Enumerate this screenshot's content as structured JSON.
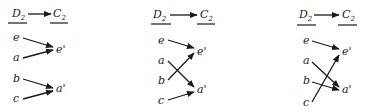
{
  "diagram": {
    "panels": [
      {
        "id": "panel-1",
        "header": {
          "source": "D",
          "source_sub": "2",
          "target": "C",
          "target_sub": "2"
        },
        "domain": [
          "e",
          "a",
          "b",
          "c"
        ],
        "codomain": [
          "e'",
          "a'"
        ],
        "mapping": {
          "e": "e'",
          "a": "e'",
          "b": "a'",
          "c": "a'"
        }
      },
      {
        "id": "panel-2",
        "header": {
          "source": "D",
          "source_sub": "2",
          "target": "C",
          "target_sub": "2"
        },
        "domain": [
          "e",
          "a",
          "b",
          "c"
        ],
        "codomain": [
          "e'",
          "a'"
        ],
        "mapping": {
          "e": "e'",
          "a": "a'",
          "b": "e'",
          "c": "a'"
        }
      },
      {
        "id": "panel-3",
        "header": {
          "source": "D",
          "source_sub": "2",
          "target": "C",
          "target_sub": "2"
        },
        "domain": [
          "e",
          "a",
          "b",
          "c"
        ],
        "codomain": [
          "e'",
          "a'"
        ],
        "mapping": {
          "e": "e'",
          "a": "a'",
          "b": "a'",
          "c": "e'"
        }
      }
    ]
  }
}
